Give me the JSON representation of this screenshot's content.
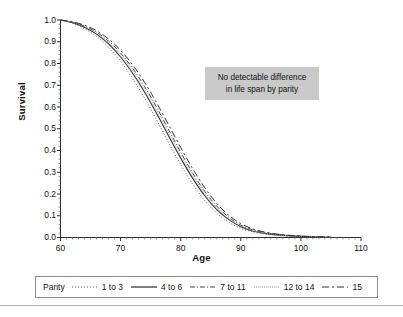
{
  "figure": {
    "background": "#ffffff",
    "width": 403,
    "height": 317
  },
  "axes": {
    "y_title": "Survival",
    "x_title": "Age",
    "y_ticks": [
      "0.0",
      "0.1",
      "0.2",
      "0.3",
      "0.4",
      "0.5",
      "0.6",
      "0.7",
      "0.8",
      "0.9",
      "1.0"
    ],
    "x_ticks": [
      "60",
      "70",
      "80",
      "90",
      "100",
      "110"
    ]
  },
  "annotation": {
    "background": "#c9c9c9",
    "line1": "No detectable difference",
    "line2": "in life span by parity"
  },
  "legend": {
    "title": "Parity",
    "entries": [
      {
        "label": "1 to 3",
        "dash": "1,2",
        "color": "#555555",
        "width": 1.0
      },
      {
        "label": "4 to 6",
        "dash": "none",
        "color": "#333333",
        "width": 1.1
      },
      {
        "label": "7 to 11",
        "dash": "5,2,1,2",
        "color": "#444444",
        "width": 1.0
      },
      {
        "label": "12 to 14",
        "dash": "1,1",
        "color": "#9a9a9a",
        "width": 0.9
      },
      {
        "label": "15",
        "dash": "7,3,2,3",
        "color": "#333333",
        "width": 1.0
      }
    ]
  },
  "chart_data": {
    "type": "line",
    "title": "",
    "xlabel": "Age",
    "ylabel": "Survival",
    "xlim": [
      60,
      110
    ],
    "ylim": [
      0.0,
      1.0
    ],
    "grid": false,
    "legend_position": "bottom",
    "x": [
      60,
      62,
      64,
      66,
      68,
      70,
      72,
      74,
      76,
      78,
      80,
      82,
      84,
      86,
      88,
      90,
      92,
      94,
      96,
      98,
      100,
      102,
      104,
      105
    ],
    "series": [
      {
        "name": "1 to 3",
        "dash": "1,2",
        "color": "#555555",
        "values": [
          1.0,
          0.985,
          0.96,
          0.925,
          0.875,
          0.81,
          0.73,
          0.64,
          0.54,
          0.435,
          0.335,
          0.245,
          0.17,
          0.112,
          0.07,
          0.042,
          0.026,
          0.016,
          0.01,
          0.006,
          0.004,
          0.002,
          0.001,
          0.001
        ]
      },
      {
        "name": "4 to 6",
        "dash": "none",
        "color": "#333333",
        "values": [
          1.0,
          0.988,
          0.967,
          0.935,
          0.89,
          0.83,
          0.755,
          0.668,
          0.57,
          0.466,
          0.365,
          0.272,
          0.192,
          0.128,
          0.082,
          0.05,
          0.03,
          0.019,
          0.012,
          0.008,
          0.005,
          0.003,
          0.002,
          0.001
        ]
      },
      {
        "name": "7 to 11",
        "dash": "5,2,1,2",
        "color": "#444444",
        "values": [
          1.0,
          0.99,
          0.972,
          0.944,
          0.903,
          0.848,
          0.778,
          0.694,
          0.598,
          0.495,
          0.392,
          0.296,
          0.212,
          0.144,
          0.093,
          0.057,
          0.035,
          0.022,
          0.014,
          0.009,
          0.006,
          0.004,
          0.002,
          0.002
        ]
      },
      {
        "name": "12 to 14",
        "dash": "1,1",
        "color": "#9a9a9a",
        "values": [
          1.0,
          0.989,
          0.969,
          0.939,
          0.896,
          0.839,
          0.767,
          0.681,
          0.584,
          0.481,
          0.379,
          0.284,
          0.202,
          0.136,
          0.087,
          0.053,
          0.032,
          0.02,
          0.013,
          0.008,
          0.005,
          0.003,
          0.002,
          0.001
        ]
      },
      {
        "name": "15",
        "dash": "7,3,2,3",
        "color": "#333333",
        "values": [
          1.0,
          0.992,
          0.976,
          0.951,
          0.913,
          0.861,
          0.794,
          0.713,
          0.619,
          0.517,
          0.414,
          0.316,
          0.229,
          0.157,
          0.102,
          0.064,
          0.039,
          0.025,
          0.016,
          0.01,
          0.007,
          0.004,
          0.003,
          0.002
        ]
      }
    ]
  }
}
